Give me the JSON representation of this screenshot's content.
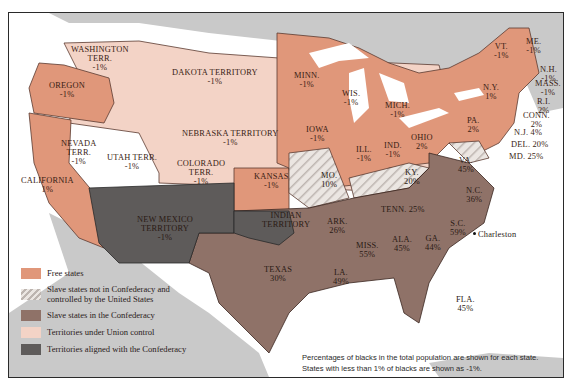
{
  "map": {
    "title": "United States 1861 — Free states, slave states, and territories",
    "colors": {
      "free_states": "#e0977a",
      "slave_union": "#e8e2de",
      "slave_confederacy": "#8f7268",
      "territory_union": "#f3d3c6",
      "territory_confederacy": "#5e5b5a",
      "foreign_land": "#c9c9c9",
      "water": "#ffffff"
    },
    "regions": [
      {
        "name": "WASHINGTON TERR.",
        "pct": "-1%",
        "category": "territory_union"
      },
      {
        "name": "DAKOTA TERRITORY",
        "pct": "-1%",
        "category": "territory_union"
      },
      {
        "name": "OREGON",
        "pct": "-1%",
        "category": "free_states"
      },
      {
        "name": "NEBRASKA TERRITORY",
        "pct": "-1%",
        "category": "territory_union"
      },
      {
        "name": "NEVADA TERR.",
        "pct": "-1%",
        "category": "territory_union"
      },
      {
        "name": "UTAH TERR.",
        "pct": "-1%",
        "category": "territory_union"
      },
      {
        "name": "COLORADO TERR.",
        "pct": "-1%",
        "category": "territory_union"
      },
      {
        "name": "CALIFORNIA",
        "pct": "1%",
        "category": "free_states"
      },
      {
        "name": "KANSAS",
        "pct": "-1%",
        "category": "free_states"
      },
      {
        "name": "NEW MEXICO TERRITORY",
        "pct": "-1%",
        "category": "territory_confederacy"
      },
      {
        "name": "INDIAN TERRITORY",
        "pct": "",
        "category": "territory_confederacy"
      },
      {
        "name": "TEXAS",
        "pct": "30%",
        "category": "slave_confederacy"
      },
      {
        "name": "MINN.",
        "pct": "-1%",
        "category": "free_states"
      },
      {
        "name": "IOWA",
        "pct": "-1%",
        "category": "free_states"
      },
      {
        "name": "WIS.",
        "pct": "-1%",
        "category": "free_states"
      },
      {
        "name": "MICH.",
        "pct": "-1%",
        "category": "free_states"
      },
      {
        "name": "ILL.",
        "pct": "-1%",
        "category": "free_states"
      },
      {
        "name": "IND.",
        "pct": "-1%",
        "category": "free_states"
      },
      {
        "name": "OHIO",
        "pct": "2%",
        "category": "free_states"
      },
      {
        "name": "PA.",
        "pct": "2%",
        "category": "free_states"
      },
      {
        "name": "N.Y.",
        "pct": "1%",
        "category": "free_states"
      },
      {
        "name": "VT.",
        "pct": "-1%",
        "category": "free_states"
      },
      {
        "name": "ME.",
        "pct": "-1%",
        "category": "free_states"
      },
      {
        "name": "N.H.",
        "pct": "-1%",
        "category": "free_states"
      },
      {
        "name": "MASS.",
        "pct": "-1%",
        "category": "free_states"
      },
      {
        "name": "R.I.",
        "pct": "2%",
        "category": "free_states"
      },
      {
        "name": "CONN.",
        "pct": "2%",
        "category": "free_states"
      },
      {
        "name": "N.J.",
        "pct": "4%",
        "category": "free_states"
      },
      {
        "name": "DEL.",
        "pct": "20%",
        "category": "slave_union"
      },
      {
        "name": "MD.",
        "pct": "25%",
        "category": "slave_union"
      },
      {
        "name": "MO.",
        "pct": "10%",
        "category": "slave_union"
      },
      {
        "name": "KY.",
        "pct": "20%",
        "category": "slave_union"
      },
      {
        "name": "VA.",
        "pct": "45%",
        "category": "slave_confederacy"
      },
      {
        "name": "N.C.",
        "pct": "36%",
        "category": "slave_confederacy"
      },
      {
        "name": "TENN.",
        "pct": "25%",
        "category": "slave_confederacy"
      },
      {
        "name": "ARK.",
        "pct": "26%",
        "category": "slave_confederacy"
      },
      {
        "name": "S.C.",
        "pct": "59%",
        "category": "slave_confederacy"
      },
      {
        "name": "MISS.",
        "pct": "55%",
        "category": "slave_confederacy"
      },
      {
        "name": "ALA.",
        "pct": "45%",
        "category": "slave_confederacy"
      },
      {
        "name": "GA.",
        "pct": "44%",
        "category": "slave_confederacy"
      },
      {
        "name": "LA.",
        "pct": "49%",
        "category": "slave_confederacy"
      },
      {
        "name": "FLA.",
        "pct": "45%",
        "category": "slave_confederacy"
      }
    ],
    "cities": [
      {
        "name": "Charleston"
      }
    ]
  },
  "labels": {
    "washington_1": "WASHINGTON",
    "washington_2": "TERR.",
    "washington_pct": "-1%",
    "dakota_1": "DAKOTA TERRITORY",
    "dakota_pct": "-1%",
    "oregon_1": "OREGON",
    "oregon_pct": "-1%",
    "nebraska_1": "NEBRASKA TERRITORY",
    "nebraska_pct": "-1%",
    "nevada_1": "NEVADA",
    "nevada_2": "TERR.",
    "nevada_pct": "-1%",
    "utah_1": "UTAH TERR.",
    "utah_pct": "-1%",
    "colorado_1": "COLORADO",
    "colorado_2": "TERR.",
    "colorado_pct": "-1%",
    "california_1": "CALIFORNIA",
    "california_pct": "1%",
    "kansas_1": "KANSAS",
    "kansas_pct": "-1%",
    "newmexico_1": "NEW MEXICO",
    "newmexico_2": "TERRITORY",
    "newmexico_pct": "-1%",
    "indian_1": "INDIAN",
    "indian_2": "TERRITORY",
    "texas_1": "TEXAS",
    "texas_pct": "30%",
    "minn_1": "MINN.",
    "minn_pct": "-1%",
    "iowa_1": "IOWA",
    "iowa_pct": "-1%",
    "wis_1": "WIS.",
    "wis_pct": "-1%",
    "mich_1": "MICH.",
    "mich_pct": "-1%",
    "ill_1": "ILL.",
    "ill_pct": "-1%",
    "ind_1": "IND.",
    "ind_pct": "-1%",
    "ohio_1": "OHIO",
    "ohio_pct": "2%",
    "pa_1": "PA.",
    "pa_pct": "2%",
    "ny_1": "N.Y.",
    "ny_pct": "1%",
    "vt_1": "VT.",
    "vt_pct": "-1%",
    "me_1": "ME.",
    "me_pct": "-1%",
    "nh_1": "N.H.",
    "nh_pct": "-1%",
    "mass_1": "MASS.",
    "mass_pct": "-1%",
    "ri_1": "R.I.",
    "ri_pct": "2%",
    "conn_1": "CONN.",
    "conn_pct": "2%",
    "nj": "N.J. 4%",
    "del": "DEL. 20%",
    "md": "MD. 25%",
    "mo_1": "MO.",
    "mo_pct": "10%",
    "ky_1": "KY.",
    "ky_pct": "20%",
    "va_1": "VA.",
    "va_pct": "45%",
    "nc_1": "N.C.",
    "nc_pct": "36%",
    "tenn": "TENN. 25%",
    "ark_1": "ARK.",
    "ark_pct": "26%",
    "sc_1": "S.C.",
    "sc_pct": "59%",
    "miss_1": "MISS.",
    "miss_pct": "55%",
    "ala_1": "ALA.",
    "ala_pct": "45%",
    "ga_1": "GA.",
    "ga_pct": "44%",
    "la_1": "LA.",
    "la_pct": "49%",
    "fla_1": "FLA.",
    "fla_pct": "45%",
    "charleston": "Charleston"
  },
  "legend": {
    "items": [
      {
        "label": "Free states",
        "color": "#e0977a"
      },
      {
        "label": "Slave states not in Confederacy and controlled by the United States",
        "color": "hatched"
      },
      {
        "label": "Slave states in the Confederacy",
        "color": "#8f7268"
      },
      {
        "label": "Territories under Union control",
        "color": "#f3d3c6"
      },
      {
        "label": "Territories aligned with the Confederacy",
        "color": "#5e5b5a"
      }
    ],
    "item_1_line1": "Slave states not in Confederacy and",
    "item_1_line2": "controlled by the United States"
  },
  "note": {
    "line1": "Percentages of blacks in the total population are shown for each state.",
    "line2": "States with less than 1% of blacks are shown as -1%."
  }
}
